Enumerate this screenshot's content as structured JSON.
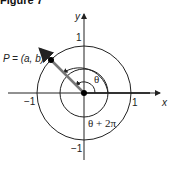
{
  "figure": {
    "title": "Figure 7",
    "axes": {
      "x_label": "x",
      "y_label": "y"
    },
    "ticks": {
      "x_neg": "−1",
      "x_pos": "1",
      "y_pos": "1",
      "y_neg": "−1"
    },
    "point_label": "P = (a, b)",
    "angle_label": "θ",
    "angle_plus_label": "θ + 2π",
    "colors": {
      "line": "#222222",
      "terminal_ray": "#555555",
      "point": "#000000"
    }
  }
}
